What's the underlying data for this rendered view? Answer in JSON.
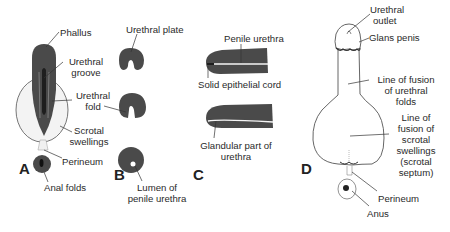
{
  "panels": {
    "A": {
      "letter": "A",
      "labels": {
        "phallus": "Phallus",
        "urethral_groove_1": "Urethral",
        "urethral_groove_2": "groove",
        "urethral_fold_1": "Urethral",
        "urethral_fold_2": "fold",
        "scrotal_swellings_1": "Scrotal",
        "scrotal_swellings_2": "swellings",
        "perineum": "Perineum",
        "anal_folds": "Anal folds"
      }
    },
    "B": {
      "letter": "B",
      "labels": {
        "urethral_plate": "Urethral plate",
        "lumen_1": "Lumen of",
        "lumen_2": "penile urethra"
      }
    },
    "C": {
      "letter": "C",
      "labels": {
        "penile_urethra": "Penile urethra",
        "solid_epithelial_cord": "Solid epithelial cord",
        "glandular_1": "Glandular part of",
        "glandular_2": "urethra"
      }
    },
    "D": {
      "letter": "D",
      "labels": {
        "urethral_outlet_1": "Urethral",
        "urethral_outlet_2": "outlet",
        "glans_penis": "Glans penis",
        "fusion_urethral_1": "Line of fusion",
        "fusion_urethral_2": "of urethral",
        "fusion_urethral_3": "folds",
        "fusion_scrotal_1": "Line of",
        "fusion_scrotal_2": "fusion of",
        "fusion_scrotal_3": "scrotal",
        "fusion_scrotal_4": "swellings",
        "fusion_scrotal_5": "(scrotal",
        "fusion_scrotal_6": "septum)",
        "perineum": "Perineum",
        "anus": "Anus"
      }
    }
  },
  "colors": {
    "tissue_dark": "#4a4a4a",
    "tissue_light": "#f2f2f2",
    "outline": "#555555"
  }
}
